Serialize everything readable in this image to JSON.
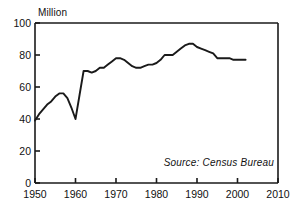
{
  "chart_data": {
    "type": "line",
    "title": "",
    "xlabel": "",
    "ylabel": "Million",
    "ylabel_position": "above-axis-top-left",
    "xlim": [
      1950,
      2010
    ],
    "ylim": [
      0,
      100
    ],
    "xticks": [
      1950,
      1960,
      1970,
      1980,
      1990,
      2000,
      2010
    ],
    "yticks": [
      0,
      20,
      40,
      60,
      80,
      100
    ],
    "grid": false,
    "legend": false,
    "annotations": [
      {
        "text": "Source: Census Bureau",
        "position": "bottom-right-inside",
        "style": "italic"
      }
    ],
    "line_color": "#1a1a1a",
    "series": [
      {
        "name": "Million",
        "x": [
          1950,
          1951,
          1952,
          1953,
          1954,
          1955,
          1956,
          1957,
          1958,
          1959,
          1960,
          1961,
          1962,
          1963,
          1964,
          1965,
          1966,
          1967,
          1968,
          1969,
          1970,
          1971,
          1972,
          1973,
          1974,
          1975,
          1976,
          1977,
          1978,
          1979,
          1980,
          1981,
          1982,
          1983,
          1984,
          1985,
          1986,
          1987,
          1988,
          1989,
          1990,
          1991,
          1992,
          1993,
          1994,
          1995,
          1996,
          1997,
          1998,
          1999,
          2000,
          2001,
          2002
        ],
        "values": [
          39,
          43,
          46,
          49,
          51,
          54,
          56,
          56,
          53,
          47,
          40,
          55,
          70,
          70,
          69,
          70,
          72,
          72,
          74,
          76,
          78,
          78,
          77,
          75,
          73,
          72,
          72,
          73,
          74,
          74,
          75,
          77,
          80,
          80,
          80,
          82,
          84,
          86,
          87,
          87,
          85,
          84,
          83,
          82,
          81,
          78,
          78,
          78,
          78,
          77,
          77,
          77,
          77
        ]
      }
    ]
  },
  "yaxis": {
    "label": "Million",
    "ticks": [
      {
        "value": 100,
        "label": "100"
      },
      {
        "value": 80,
        "label": "80"
      },
      {
        "value": 60,
        "label": "60"
      },
      {
        "value": 40,
        "label": "40"
      },
      {
        "value": 20,
        "label": "20"
      },
      {
        "value": 0,
        "label": "0"
      }
    ]
  },
  "xaxis": {
    "ticks": [
      {
        "value": 1950,
        "label": "1950"
      },
      {
        "value": 1960,
        "label": "1960"
      },
      {
        "value": 1970,
        "label": "1970"
      },
      {
        "value": 1980,
        "label": "1980"
      },
      {
        "value": 1990,
        "label": "1990"
      },
      {
        "value": 2000,
        "label": "2000"
      },
      {
        "value": 2010,
        "label": "2010"
      }
    ]
  },
  "source_note": "Source: Census Bureau"
}
